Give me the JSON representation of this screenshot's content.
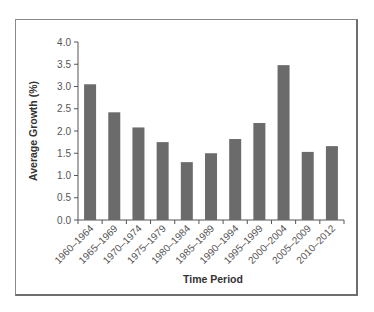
{
  "chart_data": {
    "type": "bar",
    "title": "",
    "xlabel": "Time Period",
    "ylabel": "Average Growth (%)",
    "categories": [
      "1960–1964",
      "1965–1969",
      "1970–1974",
      "1975–1979",
      "1980–1984",
      "1985–1989",
      "1990–1994",
      "1995–1999",
      "2000–2004",
      "2005–2009",
      "2010–2012"
    ],
    "values": [
      3.05,
      2.42,
      2.08,
      1.75,
      1.3,
      1.5,
      1.82,
      2.18,
      3.48,
      1.53,
      1.66
    ],
    "ylim": [
      0,
      4.0
    ],
    "yticks": [
      "0.0",
      "0.5",
      "1.0",
      "1.5",
      "2.0",
      "2.5",
      "3.0",
      "3.5",
      "4.0"
    ],
    "grid": false,
    "legend": null,
    "bar_color": "#6b6b6b"
  }
}
